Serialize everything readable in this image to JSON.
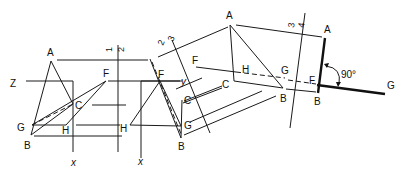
{
  "diagram": {
    "views": [
      {
        "id": "view-1-front",
        "points": {
          "A": "A",
          "F": "F",
          "C": "C",
          "G": "G",
          "H": "H",
          "B": "B"
        },
        "ref_labels": {
          "z": "Z",
          "x": "x"
        }
      },
      {
        "id": "view-2-top",
        "points": {
          "A": "",
          "F": "F",
          "C": "C",
          "G": "G",
          "H": "H",
          "B": "B"
        },
        "ref_labels": {
          "x": "x",
          "y": "y"
        }
      },
      {
        "id": "view-3-auxiliary",
        "points": {
          "A": "A",
          "F": "F",
          "C": "C",
          "G": "G",
          "H": "H",
          "B": "B"
        }
      },
      {
        "id": "view-4-edge",
        "points": {
          "A": "A",
          "F": "F",
          "B": "B",
          "G": "G"
        },
        "angle_label": "90°"
      }
    ],
    "fold_lines": [
      {
        "id": "1-2",
        "left": "1",
        "right": "2"
      },
      {
        "id": "2-3",
        "left": "2",
        "right": "3"
      },
      {
        "id": "3-4",
        "left": "3",
        "right": "4"
      }
    ]
  }
}
